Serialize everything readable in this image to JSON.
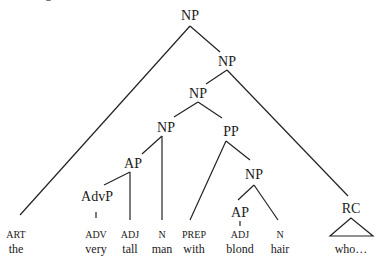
{
  "diagram": {
    "type": "syntax-tree",
    "nodes": {
      "np_root": "NP",
      "np2": "NP",
      "np3": "NP",
      "np4": "NP",
      "pp": "PP",
      "ap_upper": "AP",
      "advp": "AdvP",
      "np_right": "NP",
      "ap_lower": "AP",
      "rc": "RC"
    },
    "leaves": [
      {
        "category": "ART",
        "word": "the"
      },
      {
        "category": "ADV",
        "word": "very"
      },
      {
        "category": "ADJ",
        "word": "tall"
      },
      {
        "category": "N",
        "word": "man"
      },
      {
        "category": "PREP",
        "word": "with"
      },
      {
        "category": "ADJ",
        "word": "blond"
      },
      {
        "category": "N",
        "word": "hair"
      },
      {
        "category": "",
        "word": "who…"
      }
    ]
  }
}
